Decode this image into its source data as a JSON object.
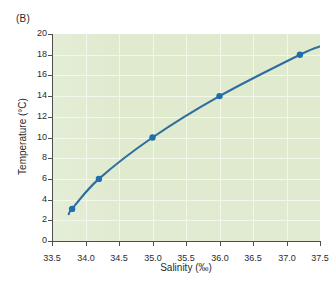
{
  "panel": {
    "label": "(B)"
  },
  "chart_data": {
    "type": "line",
    "title": "",
    "subtitle": "",
    "xlabel": "Salinity (‰)",
    "ylabel": "Temperature (°C)",
    "xlim": [
      33.5,
      37.5
    ],
    "ylim": [
      0,
      20
    ],
    "xticks": [
      33.5,
      34.0,
      34.5,
      35.0,
      35.5,
      36.0,
      36.5,
      37.0,
      37.5
    ],
    "xtick_labels": [
      "33.5",
      "34.0",
      "34.5",
      "35.0",
      "35.5",
      "36.0",
      "36.5",
      "37.0",
      "37.5"
    ],
    "yticks": [
      0,
      2,
      4,
      6,
      8,
      10,
      12,
      14,
      16,
      18,
      20
    ],
    "ytick_labels": [
      "0",
      "2",
      "4",
      "6",
      "8",
      "10",
      "12",
      "14",
      "16",
      "18",
      "20"
    ],
    "grid": true,
    "grid_color": "#f2f7ea",
    "plot_background": "#dfeacf",
    "legend": null,
    "series": [
      {
        "name": "Seawater density curve",
        "line_color": "#2f6d9e",
        "marker": "circle",
        "marker_color": "#1f6fb0",
        "x": [
          33.8,
          34.2,
          35.0,
          36.0,
          37.2
        ],
        "y": [
          3.1,
          6.0,
          10.0,
          14.0,
          18.0
        ],
        "curve_x": [
          33.75,
          33.8,
          34.2,
          35.0,
          36.0,
          37.2,
          37.5
        ],
        "curve_y": [
          2.6,
          3.1,
          6.0,
          10.0,
          14.0,
          18.0,
          18.8
        ]
      }
    ]
  },
  "axes": {
    "x_tick_count": 9,
    "y_tick_count": 11
  }
}
